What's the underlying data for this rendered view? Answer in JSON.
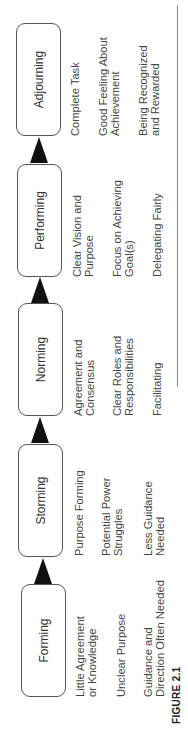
{
  "figure": {
    "label": "FIGURE 2.1",
    "stages": [
      {
        "name": "Forming",
        "items": [
          "Little Agreement\nor Knowledge",
          "Unclear Purpose",
          "Guidance and\nDirection Often Needed"
        ]
      },
      {
        "name": "Storming",
        "items": [
          "Purpose Forming",
          "Potential Power\nStruggles",
          "Less Guidance\nNeeded"
        ]
      },
      {
        "name": "Norming",
        "items": [
          "Agreement and\nConsensus",
          "Clear Roles and\nResponsibilities",
          "Facilitating"
        ]
      },
      {
        "name": "Performing",
        "items": [
          "Clear Vision and\nPurpose",
          "Focus on Achieving\nGoal(s)",
          "Delegating Fairly"
        ]
      },
      {
        "name": "Adjourning",
        "items": [
          "Complete Task",
          "Good Feeling About\nAchievement",
          "Being Recognized\nand Rewarded"
        ]
      }
    ],
    "colors": {
      "box_border": "#555555",
      "arrow": "#111111",
      "text": "#444444",
      "rule": "#8a8a8a"
    }
  }
}
